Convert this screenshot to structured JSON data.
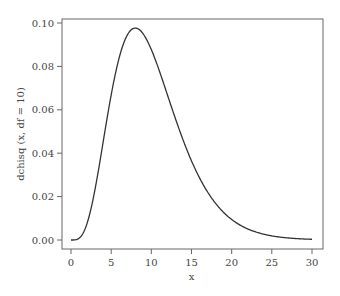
{
  "chart_data": {
    "type": "line",
    "title": "",
    "xlabel": "x",
    "ylabel": "dchisq (x, df = 10)",
    "xlim": [
      0,
      30
    ],
    "ylim": [
      0,
      0.1
    ],
    "x_ticks": [
      "0",
      "5",
      "10",
      "15",
      "20",
      "25",
      "30"
    ],
    "y_ticks": [
      "0.00",
      "0.02",
      "0.04",
      "0.06",
      "0.08",
      "0.10"
    ],
    "grid": false,
    "legend": null,
    "series": [
      {
        "name": "dchisq(x, df = 10)",
        "x": [
          0,
          1,
          2,
          3,
          4,
          5,
          6,
          7,
          8,
          9,
          10,
          11,
          12,
          13,
          14,
          15,
          16,
          17,
          18,
          19,
          20,
          22,
          24,
          26,
          28,
          30
        ],
        "values": [
          0.0,
          0.0008,
          0.0077,
          0.0251,
          0.0481,
          0.0667,
          0.0902,
          0.0951,
          0.0977,
          0.0952,
          0.0877,
          0.0786,
          0.0688,
          0.0591,
          0.05,
          0.0417,
          0.0344,
          0.0281,
          0.0228,
          0.0183,
          0.0146,
          0.0093,
          0.0057,
          0.0035,
          0.0021,
          0.0012
        ]
      }
    ],
    "line_color": "#333333"
  }
}
